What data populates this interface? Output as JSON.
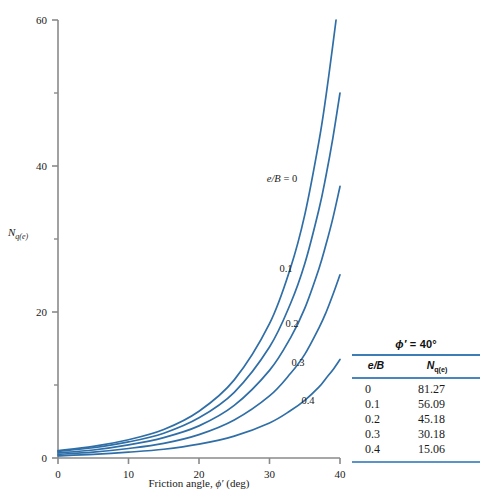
{
  "chart_data": {
    "type": "line",
    "title": "",
    "xlabel": "Friction angle, ϕ′ (deg)",
    "ylabel": "N q(e)",
    "xlim": [
      0,
      40
    ],
    "ylim": [
      0,
      60
    ],
    "xticks": [
      0,
      10,
      20,
      30,
      40
    ],
    "yticks": [
      0,
      20,
      40,
      60
    ],
    "yminorticks": [
      10,
      30,
      50
    ],
    "grid": false,
    "legend_position": "inline-curve-labels",
    "series_color": "#2f6ea6",
    "x": [
      0,
      5,
      10,
      15,
      20,
      25,
      30,
      33,
      35,
      37,
      38,
      39,
      40
    ],
    "series": [
      {
        "name": "e/B = 0",
        "label": "e/B = 0",
        "values": [
          1.0,
          1.6,
          2.5,
          3.9,
          6.4,
          10.7,
          18.4,
          26.1,
          33.3,
          43.3,
          49.5,
          56.7,
          64.2
        ]
      },
      {
        "name": "e/B = 0.1",
        "label": "0.1",
        "values": [
          0.9,
          1.4,
          2.2,
          3.4,
          5.5,
          9.0,
          15.2,
          21.2,
          26.6,
          34.0,
          38.6,
          43.9,
          50.0
        ]
      },
      {
        "name": "e/B = 0.2",
        "label": "0.2",
        "values": [
          0.7,
          1.1,
          1.8,
          2.8,
          4.4,
          7.2,
          12.0,
          16.5,
          20.5,
          25.9,
          29.2,
          32.9,
          37.2
        ]
      },
      {
        "name": "e/B = 0.3",
        "label": "0.3",
        "values": [
          0.5,
          0.8,
          1.3,
          2.0,
          3.2,
          5.2,
          8.5,
          11.6,
          14.2,
          17.8,
          19.9,
          22.4,
          25.1
        ]
      },
      {
        "name": "e/B = 0.4",
        "label": "0.4",
        "values": [
          0.3,
          0.5,
          0.8,
          1.2,
          1.9,
          3.0,
          4.8,
          6.5,
          7.9,
          9.7,
          10.9,
          12.1,
          13.5
        ]
      }
    ],
    "curve_labels": [
      {
        "text": "e/B = 0",
        "x_px": 282,
        "y_px": 182
      },
      {
        "text": "0.1",
        "x_px": 286,
        "y_px": 272
      },
      {
        "text": "0.2",
        "x_px": 292,
        "y_px": 327
      },
      {
        "text": "0.3",
        "x_px": 298,
        "y_px": 366
      },
      {
        "text": "0.4",
        "x_px": 308,
        "y_px": 404
      }
    ]
  },
  "axes": {
    "x_tick_labels": [
      "0",
      "10",
      "20",
      "30",
      "40"
    ],
    "y_tick_labels": [
      "0",
      "20",
      "40",
      "60"
    ],
    "x_axis_title_prefix": "Friction angle, ",
    "x_axis_title_symbol": "ϕ′",
    "x_axis_title_suffix": " (deg)",
    "y_axis_title_main": "N",
    "y_axis_title_sub": "q(e)"
  },
  "table": {
    "title_symbol": "ϕ′",
    "title_rest": " = 40°",
    "headers": {
      "col1": "e/B",
      "col2_main": "N",
      "col2_sub": "q(e)"
    },
    "rows": [
      {
        "eb": "0",
        "nq": "81.27"
      },
      {
        "eb": "0.1",
        "nq": "56.09"
      },
      {
        "eb": "0.2",
        "nq": "45.18"
      },
      {
        "eb": "0.3",
        "nq": "30.18"
      },
      {
        "eb": "0.4",
        "nq": "15.06"
      }
    ]
  },
  "colors": {
    "curve": "#2f6ea6",
    "axis": "#8a8a8a",
    "rule": "#3d7db5",
    "text": "#1a1a1a"
  }
}
